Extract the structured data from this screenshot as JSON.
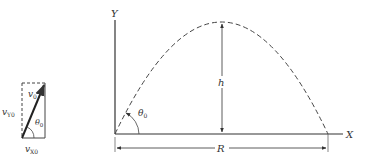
{
  "vector_diagram": {
    "v0_label": "v",
    "v0_sub": "0",
    "vy0_label": "v",
    "vy0_sub": "Y0",
    "vx0_label": "v",
    "vx0_sub": "X0",
    "theta_label": "θ",
    "theta_sub": "0"
  },
  "trajectory_diagram": {
    "y_axis_label": "Y",
    "x_axis_label": "X",
    "height_label": "h",
    "range_label": "R",
    "theta_label": "θ",
    "theta_sub": "0"
  },
  "colors": {
    "line": "#333333",
    "background": "#ffffff"
  }
}
